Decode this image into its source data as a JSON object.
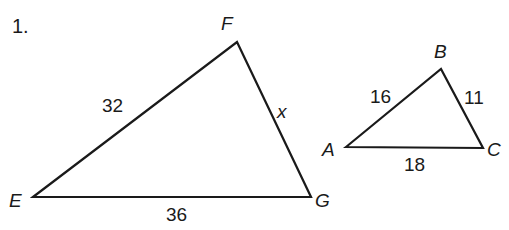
{
  "problem": {
    "number": "1."
  },
  "triangle_EFG": {
    "vertices": {
      "E": "E",
      "F": "F",
      "G": "G"
    },
    "sides": {
      "EF": "32",
      "FG": "x",
      "EG": "36"
    }
  },
  "triangle_ABC": {
    "vertices": {
      "A": "A",
      "B": "B",
      "C": "C"
    },
    "sides": {
      "AB": "16",
      "BC": "11",
      "AC": "18"
    }
  },
  "colors": {
    "stroke": "#1a1a1a",
    "background": "#ffffff"
  }
}
